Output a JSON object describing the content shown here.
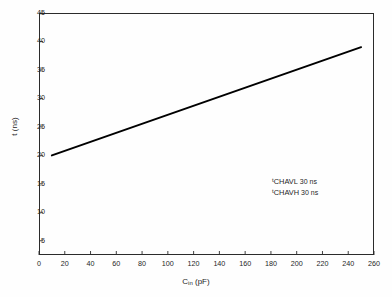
{
  "chart_data": {
    "type": "line",
    "title": "",
    "xlabel": "C_in (pF)",
    "xlabel_base": "C",
    "xlabel_sub": "in",
    "xlabel_unit": "(pF)",
    "ylabel": "t (ns)",
    "xlim": [
      0,
      260
    ],
    "ylim": [
      2.5,
      45
    ],
    "grid": false,
    "legend": "none",
    "xticks": [
      0,
      20,
      40,
      60,
      80,
      100,
      120,
      140,
      160,
      180,
      200,
      220,
      240,
      260
    ],
    "xtick_labels": [
      "0",
      "20",
      "40",
      "60",
      "80",
      "100",
      "120",
      "140",
      "160",
      "180",
      "200",
      "220",
      "240",
      "260"
    ],
    "yticks": [
      5,
      10,
      15,
      20,
      25,
      30,
      35,
      40,
      45
    ],
    "ytick_labels": [
      "5",
      "10",
      "15",
      "20",
      "25",
      "30",
      "35",
      "40",
      "45"
    ],
    "series": [
      {
        "name": "t vs Cin",
        "color": "#000000",
        "linewidth": 2.0,
        "x": [
          10,
          250
        ],
        "y": [
          20,
          39
        ]
      }
    ],
    "annotations": [
      {
        "symbol": "t",
        "subscript": "CHAVL",
        "value": "30 ns"
      },
      {
        "symbol": "t",
        "subscript": "CHAVH",
        "value": "30 ns"
      }
    ]
  },
  "figure": {
    "background": "#fefefe",
    "frame_color": "#2b2b2b",
    "text_color": "#1f1f1f"
  }
}
